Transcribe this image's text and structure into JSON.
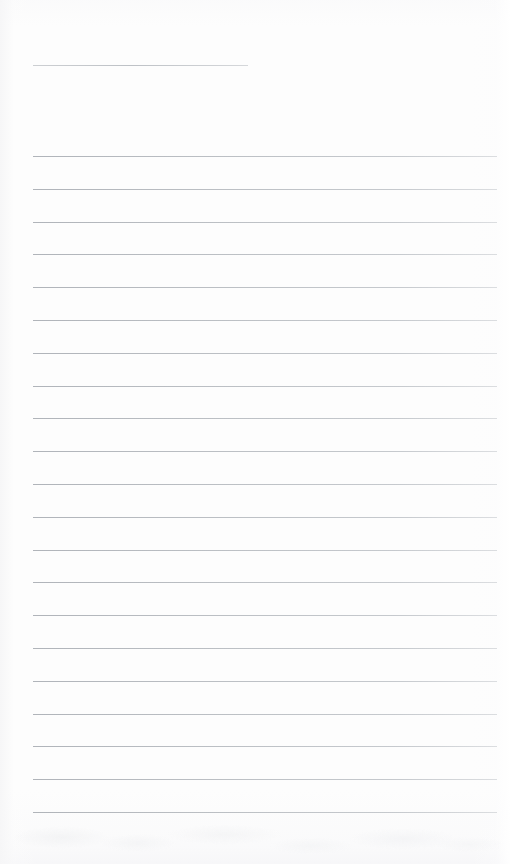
{
  "page": {
    "kind": "lined-notebook-page",
    "title": "",
    "body_text": "",
    "width": 510,
    "height": 864,
    "background_color": "#fdfdfd",
    "rule_color": "#b9bdc2",
    "header_rule_color": "#c0c4c8"
  },
  "header_rule": {
    "label": "",
    "x": 33,
    "y": 65,
    "width": 215
  },
  "ruled_lines": {
    "count": 21,
    "x": 33,
    "width": 464,
    "start_y": 156,
    "spacing": 32.8,
    "lines": [
      {
        "index": 1,
        "y": 156,
        "text": ""
      },
      {
        "index": 2,
        "y": 189,
        "text": ""
      },
      {
        "index": 3,
        "y": 222,
        "text": ""
      },
      {
        "index": 4,
        "y": 254,
        "text": ""
      },
      {
        "index": 5,
        "y": 287,
        "text": ""
      },
      {
        "index": 6,
        "y": 320,
        "text": ""
      },
      {
        "index": 7,
        "y": 353,
        "text": ""
      },
      {
        "index": 8,
        "y": 386,
        "text": ""
      },
      {
        "index": 9,
        "y": 418,
        "text": ""
      },
      {
        "index": 10,
        "y": 451,
        "text": ""
      },
      {
        "index": 11,
        "y": 484,
        "text": ""
      },
      {
        "index": 12,
        "y": 517,
        "text": ""
      },
      {
        "index": 13,
        "y": 550,
        "text": ""
      },
      {
        "index": 14,
        "y": 582,
        "text": ""
      },
      {
        "index": 15,
        "y": 615,
        "text": ""
      },
      {
        "index": 16,
        "y": 648,
        "text": ""
      },
      {
        "index": 17,
        "y": 681,
        "text": ""
      },
      {
        "index": 18,
        "y": 714,
        "text": ""
      },
      {
        "index": 19,
        "y": 746,
        "text": ""
      },
      {
        "index": 20,
        "y": 779,
        "text": ""
      },
      {
        "index": 21,
        "y": 812,
        "text": ""
      }
    ]
  },
  "footer_margin": {
    "label": "",
    "top": 813,
    "height": 51
  }
}
